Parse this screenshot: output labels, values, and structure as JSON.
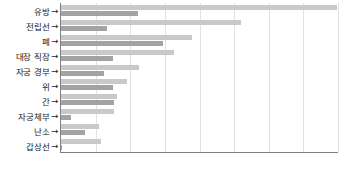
{
  "chart_data": {
    "type": "bar",
    "orientation": "horizontal",
    "title": "",
    "xlabel": "",
    "ylabel": "",
    "grid": true,
    "legend": "none",
    "xlim": [
      0,
      8
    ],
    "categories": [
      "유방",
      "전립선",
      "폐",
      "대장 직장",
      "자궁 경부",
      "위",
      "간",
      "자궁체부",
      "난소",
      "갑상선"
    ],
    "series": [
      {
        "name": "series-1",
        "color": "#c9c9c9",
        "values": [
          7.97,
          5.2,
          3.79,
          3.27,
          2.24,
          1.92,
          1.61,
          1.52,
          1.09,
          1.15
        ]
      },
      {
        "name": "series-2",
        "color": "#a3a3a3",
        "values": [
          2.21,
          1.32,
          2.96,
          1.49,
          1.23,
          1.49,
          1.52,
          0.29,
          0.69,
          0.03
        ]
      }
    ]
  },
  "axis": {
    "arrow_glyph": "→",
    "gridline_count": 8
  },
  "colors": {
    "light_bar": "#c9c9c9",
    "dark_bar": "#a3a3a3",
    "gridline": "#e2e2e2",
    "axis": "#808080",
    "label_text": "#1a1a1a"
  }
}
